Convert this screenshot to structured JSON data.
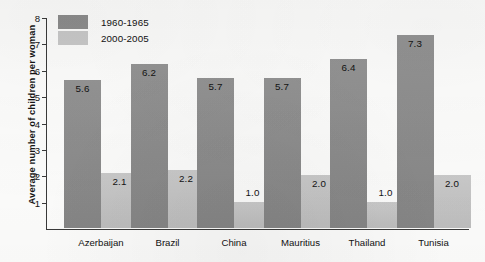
{
  "chart_data": {
    "type": "bar",
    "title": "",
    "xlabel": "",
    "ylabel": "Average number of children per woman",
    "categories": [
      "Azerbaijan",
      "Brazil",
      "China",
      "Mauritius",
      "Thailand",
      "Tunisia"
    ],
    "series": [
      {
        "name": "1960-1965",
        "color": "#8d8d8d",
        "values": [
          5.6,
          6.2,
          5.7,
          5.7,
          6.4,
          7.3
        ],
        "value_labels": [
          "5.6",
          "6.2",
          "5.7",
          "5.7",
          "6.4",
          "7.3"
        ]
      },
      {
        "name": "2000-2005",
        "color": "#c6c6c6",
        "values": [
          2.1,
          2.2,
          1.0,
          2.0,
          1.0,
          2.0
        ],
        "value_labels": [
          "2.1",
          "2.2",
          "1.0",
          "2.0",
          "1.0",
          "2.0"
        ]
      }
    ],
    "ylim": [
      0,
      8
    ],
    "yticks": [
      1,
      2,
      3,
      4,
      5,
      6,
      7,
      8
    ],
    "ytick_labels": [
      "1",
      "2",
      "3",
      "4",
      "5",
      "6",
      "7",
      "8"
    ],
    "grid": false,
    "legend_position": "top-left-inside"
  },
  "legend": {
    "items": [
      {
        "label": "1960-1965"
      },
      {
        "label": "2000-2005"
      }
    ]
  }
}
